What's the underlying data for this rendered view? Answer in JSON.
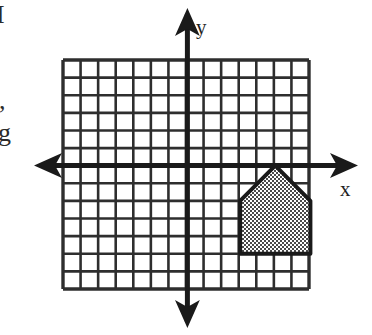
{
  "figure": {
    "axis_labels": {
      "x": "x",
      "y": "y"
    },
    "edge_text_fragments": {
      "top": "I",
      "middle": ",",
      "lower": "g"
    },
    "colors": {
      "grid_line": "#2e2e2e",
      "axis_line": "#1a1a1a",
      "shape_fill": "#6e6e6e",
      "shape_outline": "#1a1a1a",
      "background": "#ffffff"
    },
    "grid": {
      "columns": 14,
      "rows": 13,
      "cell_size_px": 17.6,
      "left_px": 63,
      "top_px": 60,
      "right_px": 309,
      "bottom_px": 289,
      "origin_x_px": 187.4,
      "origin_y_px": 165.6,
      "columns_left_of_origin": 7,
      "columns_right_of_origin": 7,
      "rows_above_origin": 6,
      "rows_below_origin": 7
    },
    "axes": {
      "x_axis_y_px": 165.6,
      "y_axis_x_px": 187.4,
      "x_axis_start_px": 40,
      "x_axis_end_px": 352,
      "y_axis_start_px": 14,
      "y_axis_end_px": 322,
      "arrow_directions": [
        "left",
        "right",
        "up",
        "down"
      ]
    }
  },
  "chart_data": {
    "type": "scatter",
    "xlabel": "x",
    "ylabel": "y",
    "xlim": [
      -7,
      7
    ],
    "ylim": [
      -7,
      6
    ],
    "grid": true,
    "legend": "none",
    "shapes": [
      {
        "name": "house-pentagon",
        "kind": "polygon",
        "fill": "#6e6e6e",
        "fill_pattern": "checker-dither",
        "stroke": "#1a1a1a",
        "vertices": [
          [
            3,
            -2
          ],
          [
            5,
            0
          ],
          [
            7,
            -2
          ],
          [
            7,
            -5
          ],
          [
            3,
            -5
          ]
        ],
        "quadrant": "IV",
        "width_units": 4,
        "wall_height_units": 3,
        "roof_height_units": 2,
        "apex": [
          5,
          0
        ]
      }
    ],
    "annotations": [
      {
        "text": "x",
        "x_px": 345,
        "y_px": 188
      },
      {
        "text": "y",
        "x_px": 201,
        "y_px": 26
      }
    ]
  }
}
